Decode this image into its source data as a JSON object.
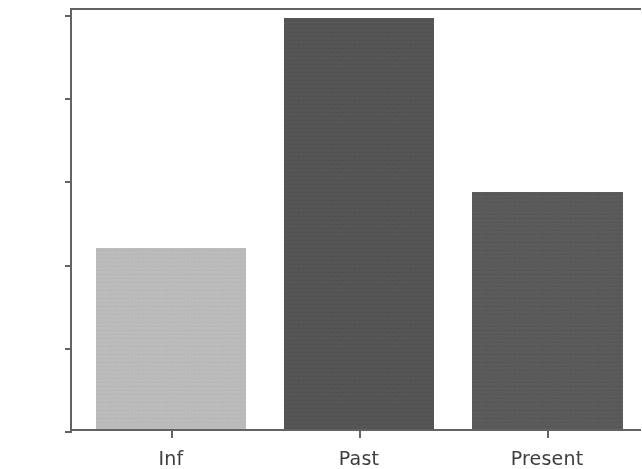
{
  "chart_data": {
    "type": "bar",
    "title": "",
    "subtitle": "",
    "xlabel": "",
    "ylabel": "",
    "categories": [
      "Inf",
      "Past",
      "Present"
    ],
    "values": [
      4320,
      9800,
      5660
    ],
    "series": [
      {
        "name": "count",
        "values": [
          4320,
          9800,
          5660
        ]
      }
    ],
    "bar_colors": [
      "#b6b6b6",
      "#4a4a4a",
      "#505050"
    ],
    "ylim": [
      0,
      10000
    ],
    "xlim": [
      0,
      3
    ],
    "yticks": [
      0,
      2000,
      4000,
      6000,
      8000,
      10000
    ],
    "ytick_labels": [
      "0",
      "2000",
      "4000",
      "6000",
      "8000",
      "10000"
    ],
    "xtick_labels": [
      "Inf",
      "Past",
      "Present"
    ],
    "grid": false,
    "legend": false,
    "legend_position": "none",
    "annotations": [],
    "axis_color": "#5b5b5b",
    "tick_label_color": "#3b3b3b",
    "background_color": "#ffffff"
  },
  "figure": {
    "width": 642,
    "height": 456
  }
}
